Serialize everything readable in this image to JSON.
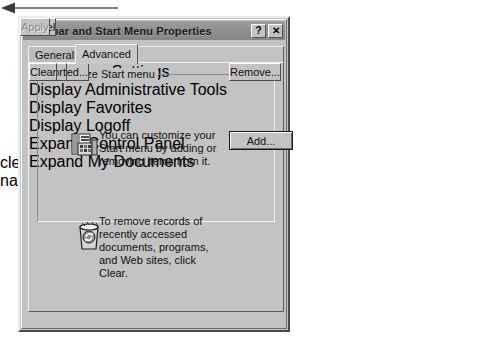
{
  "dialog": {
    "title": "Taskbar and Start Menu Properties",
    "help_button": "?",
    "close_button": "✕",
    "tabs": [
      {
        "label": "General",
        "active": false
      },
      {
        "label": "Advanced",
        "active": true
      }
    ],
    "group": {
      "legend": "Customize Start menu",
      "customize": {
        "icon": "start-menu-customize-icon",
        "description": "You can customize your Start menu by adding or removing items from it.",
        "buttons": [
          {
            "label": "Add...",
            "default": true,
            "disabled": false
          },
          {
            "label": "Remove...",
            "default": false,
            "disabled": false
          },
          {
            "label": "Advanced...",
            "default": false,
            "disabled": false
          },
          {
            "label": "Re-sort",
            "default": false,
            "disabled": false
          }
        ]
      },
      "clear_records": {
        "icon": "clear-history-icon",
        "description": "To remove records of recently accessed documents, programs, and Web sites,  click Clear.",
        "button": {
          "label": "Clear",
          "disabled": false
        }
      }
    },
    "settings": {
      "label": "Start Menu Settings",
      "items": [
        {
          "label": "Display Administrative Tools",
          "checked": false
        },
        {
          "label": "Display Favorites",
          "checked": false
        },
        {
          "label": "Display Logoff",
          "checked": false
        },
        {
          "label": "Expand Control Panel",
          "checked": false
        },
        {
          "label": "Expand My Documents",
          "checked": false
        }
      ],
      "scrollbar": {
        "up": "▲",
        "down": "▼"
      }
    },
    "footer_buttons": [
      {
        "label": "OK",
        "disabled": false
      },
      {
        "label": "Cancel",
        "disabled": false
      },
      {
        "label": "Apply",
        "disabled": true
      }
    ]
  },
  "annotation": {
    "line1": "clear document",
    "line2": "names"
  },
  "colors": {
    "dialog_face": "#c3c3c3",
    "titlebar": "#8d8d8d",
    "list_background": "#ffffff",
    "text": "#111111",
    "annotation_text": "#3d3d3d"
  }
}
